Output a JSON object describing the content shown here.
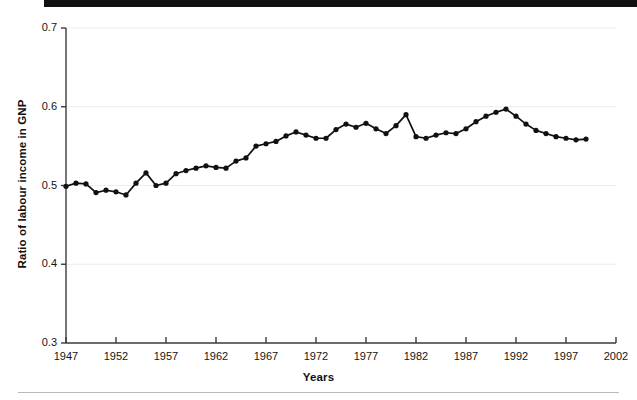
{
  "figure": {
    "xlabel": "Years",
    "ylabel": "Ratio of labour income in GNP"
  },
  "axis": {
    "y_ticks": [
      "0.3",
      "0.4",
      "0.5",
      "0.6",
      "0.7"
    ],
    "x_ticks": [
      "1947",
      "1952",
      "1957",
      "1962",
      "1967",
      "1972",
      "1977",
      "1982",
      "1987",
      "1992",
      "1997",
      "2002"
    ]
  },
  "colors": {
    "line": "#111111",
    "marker": "#111111",
    "grid": "#ededed",
    "axis": "#3c3c3c",
    "rule": "#b9b9b9",
    "header_bar": "#111111"
  },
  "chart_data": {
    "type": "line",
    "title": "",
    "xlabel": "Years",
    "ylabel": "Ratio of labour income in GNP",
    "xlim": [
      1947,
      2002
    ],
    "ylim": [
      0.3,
      0.7
    ],
    "xticks": [
      1947,
      1952,
      1957,
      1962,
      1967,
      1972,
      1977,
      1982,
      1987,
      1992,
      1997,
      2002
    ],
    "yticks": [
      0.3,
      0.4,
      0.5,
      0.6,
      0.7
    ],
    "grid": "horizontal",
    "legend": "none",
    "markers": "filled-circle",
    "x": [
      1947,
      1948,
      1949,
      1950,
      1951,
      1952,
      1953,
      1954,
      1955,
      1956,
      1957,
      1958,
      1959,
      1960,
      1961,
      1962,
      1963,
      1964,
      1965,
      1966,
      1967,
      1968,
      1969,
      1970,
      1971,
      1972,
      1973,
      1974,
      1975,
      1976,
      1977,
      1978,
      1979,
      1980,
      1981,
      1982,
      1983,
      1984,
      1985,
      1986,
      1987,
      1988,
      1989,
      1990,
      1991,
      1992,
      1993,
      1994,
      1995,
      1996,
      1997,
      1998,
      1999
    ],
    "y": [
      0.499,
      0.503,
      0.502,
      0.491,
      0.494,
      0.492,
      0.488,
      0.503,
      0.516,
      0.5,
      0.503,
      0.515,
      0.519,
      0.522,
      0.525,
      0.523,
      0.522,
      0.531,
      0.535,
      0.55,
      0.553,
      0.556,
      0.563,
      0.568,
      0.564,
      0.56,
      0.56,
      0.571,
      0.578,
      0.574,
      0.579,
      0.572,
      0.566,
      0.576,
      0.59,
      0.562,
      0.56,
      0.564,
      0.567,
      0.566,
      0.572,
      0.581,
      0.588,
      0.593,
      0.597,
      0.588,
      0.578,
      0.57,
      0.566,
      0.562,
      0.56,
      0.558,
      0.559
    ],
    "series": [
      {
        "name": "Ratio of labour income in GNP",
        "values": [
          0.499,
          0.503,
          0.502,
          0.491,
          0.494,
          0.492,
          0.488,
          0.503,
          0.516,
          0.5,
          0.503,
          0.515,
          0.519,
          0.522,
          0.525,
          0.523,
          0.522,
          0.531,
          0.535,
          0.55,
          0.553,
          0.556,
          0.563,
          0.568,
          0.564,
          0.56,
          0.56,
          0.571,
          0.578,
          0.574,
          0.579,
          0.572,
          0.566,
          0.576,
          0.59,
          0.562,
          0.56,
          0.564,
          0.567,
          0.566,
          0.572,
          0.581,
          0.588,
          0.593,
          0.597,
          0.588,
          0.578,
          0.57,
          0.566,
          0.562,
          0.56,
          0.558,
          0.559
        ]
      }
    ]
  }
}
